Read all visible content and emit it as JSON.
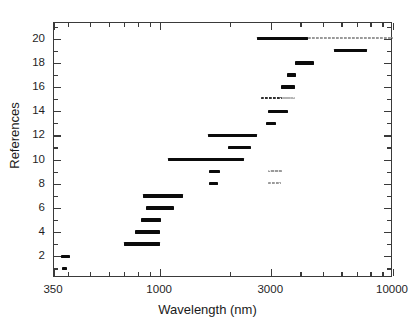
{
  "chart_data": {
    "type": "bar",
    "orientation": "horizontal-range",
    "title": "",
    "xlabel": "Wavelength (nm)",
    "ylabel": "References",
    "xscale": "log",
    "xlim": [
      350,
      10000
    ],
    "ylim": [
      0.2,
      21.3
    ],
    "grid": false,
    "legend": null,
    "xticks_major": [
      {
        "value": 350,
        "label": "350"
      },
      {
        "value": 1000,
        "label": "1000"
      },
      {
        "value": 3000,
        "label": "3000"
      },
      {
        "value": 10000,
        "label": "10000"
      }
    ],
    "xticks_minor": [
      400,
      500,
      600,
      700,
      800,
      900,
      2000,
      4000,
      5000,
      6000,
      7000,
      8000,
      9000
    ],
    "yticks_major": [
      2,
      4,
      6,
      8,
      10,
      12,
      14,
      16,
      18,
      20
    ],
    "yticks_minor": [
      1,
      3,
      5,
      7,
      9,
      11,
      13,
      15,
      17,
      19,
      21
    ],
    "ylabels": [
      "2",
      "4",
      "6",
      "8",
      "10",
      "12",
      "14",
      "16",
      "18",
      "20"
    ],
    "series_name": "Spectral coverage range per reference",
    "colors": {
      "bar_solid": "#0b0b0b",
      "bar_dotted_light": "#9a9a9a",
      "bar_dotted_dark": "#2f2f2f",
      "bar_dashed_gray": "#b4b4b4",
      "axis": "#3a3a3a",
      "text": "#1a1a1a",
      "background": "#ffffff"
    },
    "bars": [
      {
        "reference": 1,
        "x_start": 380,
        "x_end": 400,
        "style": "solid"
      },
      {
        "reference": 2,
        "x_start": 375,
        "x_end": 410,
        "style": "solid"
      },
      {
        "reference": 3,
        "x_start": 700,
        "x_end": 1000,
        "style": "solid"
      },
      {
        "reference": 4,
        "x_start": 780,
        "x_end": 1000,
        "style": "solid"
      },
      {
        "reference": 5,
        "x_start": 830,
        "x_end": 1010,
        "style": "solid"
      },
      {
        "reference": 6,
        "x_start": 870,
        "x_end": 1150,
        "style": "solid"
      },
      {
        "reference": 7,
        "x_start": 840,
        "x_end": 1250,
        "style": "solid"
      },
      {
        "reference": 8,
        "x_start": 1620,
        "x_end": 1780,
        "style": "solid"
      },
      {
        "reference": 8,
        "x_start": 2900,
        "x_end": 3300,
        "style": "dotted-light"
      },
      {
        "reference": 9,
        "x_start": 1620,
        "x_end": 1800,
        "style": "solid"
      },
      {
        "reference": 9,
        "x_start": 2900,
        "x_end": 3350,
        "style": "dotted-light"
      },
      {
        "reference": 10,
        "x_start": 1080,
        "x_end": 2300,
        "style": "solid"
      },
      {
        "reference": 11,
        "x_start": 1950,
        "x_end": 2450,
        "style": "solid"
      },
      {
        "reference": 12,
        "x_start": 1600,
        "x_end": 2600,
        "style": "solid"
      },
      {
        "reference": 13,
        "x_start": 2850,
        "x_end": 3150,
        "style": "solid"
      },
      {
        "reference": 14,
        "x_start": 2900,
        "x_end": 3550,
        "style": "solid"
      },
      {
        "reference": 15,
        "x_start": 2700,
        "x_end": 3350,
        "style": "dotted-dark"
      },
      {
        "reference": 15,
        "x_start": 3350,
        "x_end": 3800,
        "style": "dashed-gray"
      },
      {
        "reference": 16,
        "x_start": 3300,
        "x_end": 3800,
        "style": "solid"
      },
      {
        "reference": 17,
        "x_start": 3500,
        "x_end": 3850,
        "style": "solid"
      },
      {
        "reference": 18,
        "x_start": 3800,
        "x_end": 4600,
        "style": "solid"
      },
      {
        "reference": 19,
        "x_start": 5600,
        "x_end": 7700,
        "style": "solid"
      },
      {
        "reference": 20,
        "x_start": 2600,
        "x_end": 4300,
        "style": "solid"
      },
      {
        "reference": 20,
        "x_start": 4300,
        "x_end": 10000,
        "style": "dotted-light"
      }
    ]
  }
}
